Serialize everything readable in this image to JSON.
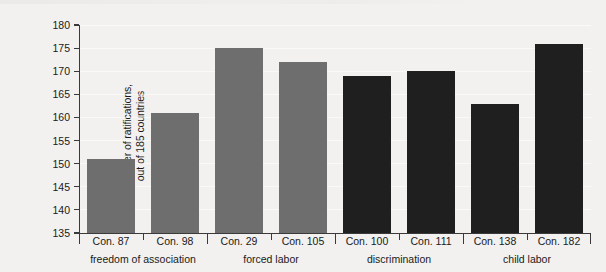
{
  "chart_data": {
    "type": "bar",
    "title": "",
    "subtitle": "",
    "xlabel": "",
    "ylabel_line1": "number of ratifications,",
    "ylabel_line2": "out of 185 countries",
    "ylim": [
      135,
      180
    ],
    "yticks": [
      135,
      140,
      145,
      150,
      155,
      160,
      165,
      170,
      175,
      180
    ],
    "grid": true,
    "legend": "none",
    "categories": [
      "Con. 87",
      "Con. 98",
      "Con. 29",
      "Con. 105",
      "Con. 100",
      "Con. 111",
      "Con. 138",
      "Con. 182"
    ],
    "values": [
      151,
      161,
      175,
      172,
      169,
      170,
      163,
      176
    ],
    "bar_colors": [
      "#6e6e6e",
      "#6e6e6e",
      "#6e6e6e",
      "#6e6e6e",
      "#1f1f1f",
      "#1f1f1f",
      "#1f1f1f",
      "#1f1f1f"
    ],
    "groups": [
      {
        "label": "freedom of association",
        "categories": [
          "Con. 87",
          "Con. 98"
        ],
        "color": "#6e6e6e"
      },
      {
        "label": "forced labor",
        "categories": [
          "Con. 29",
          "Con. 105"
        ],
        "color": "#6e6e6e"
      },
      {
        "label": "discrimination",
        "categories": [
          "Con. 100",
          "Con. 111"
        ],
        "color": "#1f1f1f"
      },
      {
        "label": "child labor",
        "categories": [
          "Con. 138",
          "Con. 182"
        ],
        "color": "#1f1f1f"
      }
    ],
    "background_color": "#f2f1ef",
    "axis_color": "#3a3a3a",
    "text_color": "#1a1a1a"
  }
}
